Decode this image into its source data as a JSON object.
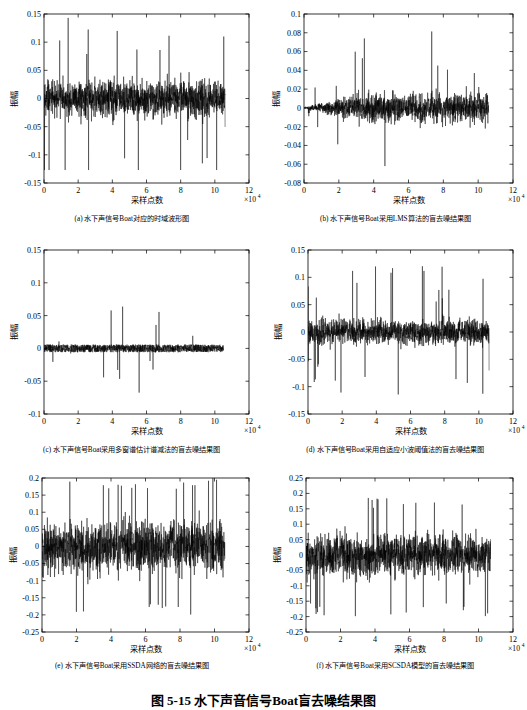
{
  "figure": {
    "caption": "图 5-15  水下声音信号Boat盲去噪结果图",
    "axis_x_label": "采样点数",
    "axis_y_label": "振幅",
    "x_exponent": "×10",
    "x_exponent_sup": "4"
  },
  "chart_data": [
    {
      "id": "a",
      "type": "line",
      "title": "(a) 水下声信号Boat对应的时域波形图",
      "xlabel": "采样点数",
      "ylabel": "振幅",
      "xlim": [
        0,
        12
      ],
      "ylim": [
        -0.15,
        0.15
      ],
      "xticks": [
        "0",
        "2",
        "4",
        "6",
        "8",
        "10",
        "12"
      ],
      "yticks": [
        "0.15",
        "0.1",
        "0.05",
        "0",
        "-0.05",
        "-0.1",
        "-0.15"
      ],
      "grid": false,
      "signal_extent_x": 10.6,
      "noise_envelope": 0.045,
      "spike_max": 0.145,
      "spike_min": -0.127,
      "series_name": "Boat 时域波形",
      "color": "#000000"
    },
    {
      "id": "b",
      "type": "line",
      "title": "(b) 水下声信号Boat采用LMS算法的盲去噪结果图",
      "xlabel": "采样点数",
      "ylabel": "振幅",
      "xlim": [
        0,
        12
      ],
      "ylim": [
        -0.08,
        0.1
      ],
      "xticks": [
        "0",
        "2",
        "4",
        "6",
        "8",
        "10",
        "12"
      ],
      "yticks": [
        "0.1",
        "0.08",
        "0.06",
        "0.04",
        "0.02",
        "0",
        "-0.02",
        "-0.04",
        "-0.06",
        "-0.08"
      ],
      "grid": false,
      "signal_extent_x": 10.6,
      "noise_envelope": 0.022,
      "spike_max": 0.091,
      "spike_min": -0.062,
      "series_name": "LMS 去噪结果",
      "color": "#000000"
    },
    {
      "id": "c",
      "type": "line",
      "title": "(c) 水下声信号Boat采用多窗谱估计谱减法的盲去噪结果图",
      "xlabel": "采样点数",
      "ylabel": "振幅",
      "xlim": [
        0,
        12
      ],
      "ylim": [
        -0.1,
        0.15
      ],
      "xticks": [
        "0",
        "2",
        "4",
        "6",
        "8",
        "10",
        "12"
      ],
      "yticks": [
        "0.15",
        "0.1",
        "0.05",
        "0",
        "-0.05",
        "-0.1"
      ],
      "grid": false,
      "signal_extent_x": 10.5,
      "noise_envelope": 0.006,
      "spike_max": 0.101,
      "spike_min": -0.085,
      "series_name": "多窗谱估计谱减法 去噪结果",
      "color": "#000000"
    },
    {
      "id": "d",
      "type": "line",
      "title": "(d) 水下声信号Boat采用自适应小波阈值法的盲去噪结果图",
      "xlabel": "采样点数",
      "ylabel": "振幅",
      "xlim": [
        0,
        12
      ],
      "ylim": [
        -0.15,
        0.15
      ],
      "xticks": [
        "0",
        "2",
        "4",
        "6",
        "8",
        "10",
        "12"
      ],
      "yticks": [
        "0.15",
        "0.1",
        "0.05",
        "0",
        "-0.05",
        "-0.1",
        "-0.15"
      ],
      "grid": false,
      "signal_extent_x": 10.6,
      "noise_envelope": 0.032,
      "spike_max": 0.127,
      "spike_min": -0.118,
      "series_name": "自适应小波阈值法 去噪结果",
      "color": "#000000"
    },
    {
      "id": "e",
      "type": "line",
      "title": "(e) 水下声信号Boat采用SSDA网络的盲去噪结果图",
      "xlabel": "采样点数",
      "ylabel": "振幅",
      "xlim": [
        0,
        12
      ],
      "ylim": [
        -0.25,
        0.2
      ],
      "xticks": [
        "0",
        "2",
        "4",
        "6",
        "8",
        "10",
        "12"
      ],
      "yticks": [
        "0.2",
        "0.15",
        "0.1",
        "0.05",
        "0",
        "-0.05",
        "-0.1",
        "-0.15",
        "-0.2",
        "-0.25"
      ],
      "grid": false,
      "signal_extent_x": 10.6,
      "noise_envelope": 0.105,
      "spike_max": 0.2,
      "spike_min": -0.235,
      "series_name": "SSDA网络 去噪结果",
      "color": "#000000"
    },
    {
      "id": "f",
      "type": "line",
      "title": "(f) 水下声信号Boat采用SCSDA模型的盲去噪结果图",
      "xlabel": "采样点数",
      "ylabel": "振幅",
      "xlim": [
        0,
        12
      ],
      "ylim": [
        -0.25,
        0.25
      ],
      "xticks": [
        "0",
        "2",
        "4",
        "6",
        "8",
        "10",
        "12"
      ],
      "yticks": [
        "0.25",
        "0.2",
        "0.15",
        "0.1",
        "0.05",
        "0",
        "-0.05",
        "-0.1",
        "-0.15",
        "-0.2",
        "-0.25"
      ],
      "grid": false,
      "signal_extent_x": 10.7,
      "noise_envelope": 0.095,
      "spike_max": 0.2,
      "spike_min": -0.235,
      "series_name": "SCSDA模型 去噪结果",
      "color": "#000000"
    }
  ]
}
